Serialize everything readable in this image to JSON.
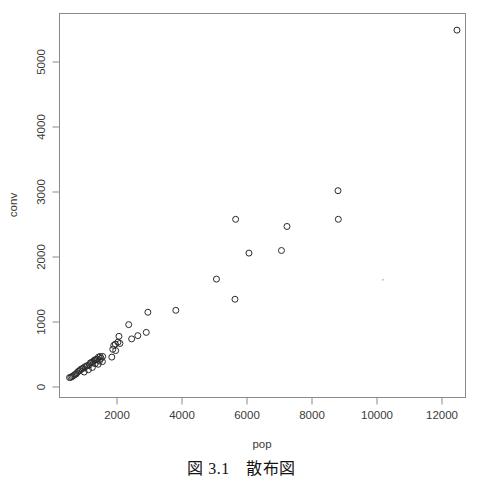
{
  "caption": {
    "text": "図 3.1　散布図"
  },
  "figure": {
    "x_axis_title": "pop",
    "y_axis_title": "conv"
  },
  "chart_data": {
    "type": "scatter",
    "title": "",
    "xlabel": "pop",
    "ylabel": "conv",
    "xlim": [
      430,
      12900
    ],
    "ylim": [
      -60,
      5620
    ],
    "xticks": [
      2000,
      4000,
      6000,
      8000,
      10000,
      12000
    ],
    "yticks": [
      0,
      1000,
      2000,
      3000,
      4000,
      5000
    ],
    "xtick_labels": [
      "2000",
      "4000",
      "6000",
      "8000",
      "10000",
      "12000"
    ],
    "ytick_labels": [
      "0",
      "1000",
      "2000",
      "3000",
      "4000",
      "5000"
    ],
    "grid": false,
    "legend": null,
    "marker": "open-circle",
    "marker_color": "#2b2b2b",
    "series": [
      {
        "name": "prefectures",
        "points": [
          [
            12460,
            5490
          ],
          [
            8800,
            3020
          ],
          [
            8810,
            2580
          ],
          [
            5650,
            2580
          ],
          [
            7230,
            2470
          ],
          [
            7060,
            2100
          ],
          [
            6060,
            2060
          ],
          [
            5060,
            1660
          ],
          [
            5630,
            1350
          ],
          [
            3810,
            1180
          ],
          [
            2950,
            1150
          ],
          [
            2360,
            960
          ],
          [
            2900,
            840
          ],
          [
            2640,
            790
          ],
          [
            2060,
            780
          ],
          [
            2450,
            740
          ],
          [
            2030,
            690
          ],
          [
            2090,
            670
          ],
          [
            1950,
            660
          ],
          [
            1900,
            640
          ],
          [
            1870,
            580
          ],
          [
            1960,
            560
          ],
          [
            1840,
            460
          ],
          [
            1560,
            470
          ],
          [
            1480,
            470
          ],
          [
            1430,
            460
          ],
          [
            1510,
            440
          ],
          [
            1400,
            430
          ],
          [
            1370,
            420
          ],
          [
            1330,
            420
          ],
          [
            1300,
            410
          ],
          [
            1460,
            400
          ],
          [
            1550,
            390
          ],
          [
            1260,
            390
          ],
          [
            1220,
            380
          ],
          [
            1180,
            370
          ],
          [
            1330,
            360
          ],
          [
            1420,
            350
          ],
          [
            1150,
            340
          ],
          [
            1090,
            330
          ],
          [
            1060,
            320
          ],
          [
            1010,
            310
          ],
          [
            1240,
            300
          ],
          [
            960,
            290
          ],
          [
            920,
            280
          ],
          [
            880,
            270
          ],
          [
            1120,
            265
          ],
          [
            850,
            250
          ],
          [
            810,
            240
          ],
          [
            990,
            230
          ],
          [
            770,
            220
          ],
          [
            740,
            200
          ],
          [
            700,
            190
          ],
          [
            660,
            175
          ],
          [
            620,
            160
          ],
          [
            580,
            150
          ],
          [
            540,
            145
          ]
        ]
      }
    ],
    "annotations": [
      {
        "x": 10180,
        "y": 1650,
        "kind": "speck"
      }
    ]
  }
}
